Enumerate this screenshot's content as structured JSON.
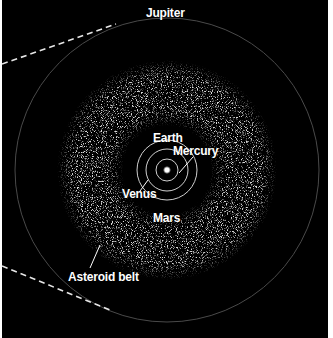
{
  "diagram": {
    "colors": {
      "background": "#000000",
      "orbit_inner": "#d9d9d9",
      "orbit_jupiter": "#555555",
      "belt": "#bdbdbd",
      "dashed": "#e6e6e6",
      "text": "#ffffff"
    },
    "labels": {
      "jupiter": "Jupiter",
      "earth": "Earth",
      "mercury": "Mercury",
      "venus": "Venus",
      "mars": "Mars",
      "asteroid_belt": "Asteroid belt"
    },
    "bodies": [
      {
        "name": "Sun",
        "orbit_radius_px": 0
      },
      {
        "name": "Mercury",
        "orbit_radius_px": 11
      },
      {
        "name": "Venus",
        "orbit_radius_px": 21
      },
      {
        "name": "Earth",
        "orbit_radius_px": 30
      },
      {
        "name": "Asteroid belt",
        "inner_radius_px": 50,
        "outer_radius_px": 105
      },
      {
        "name": "Jupiter",
        "orbit_radius_px": 152
      }
    ]
  }
}
